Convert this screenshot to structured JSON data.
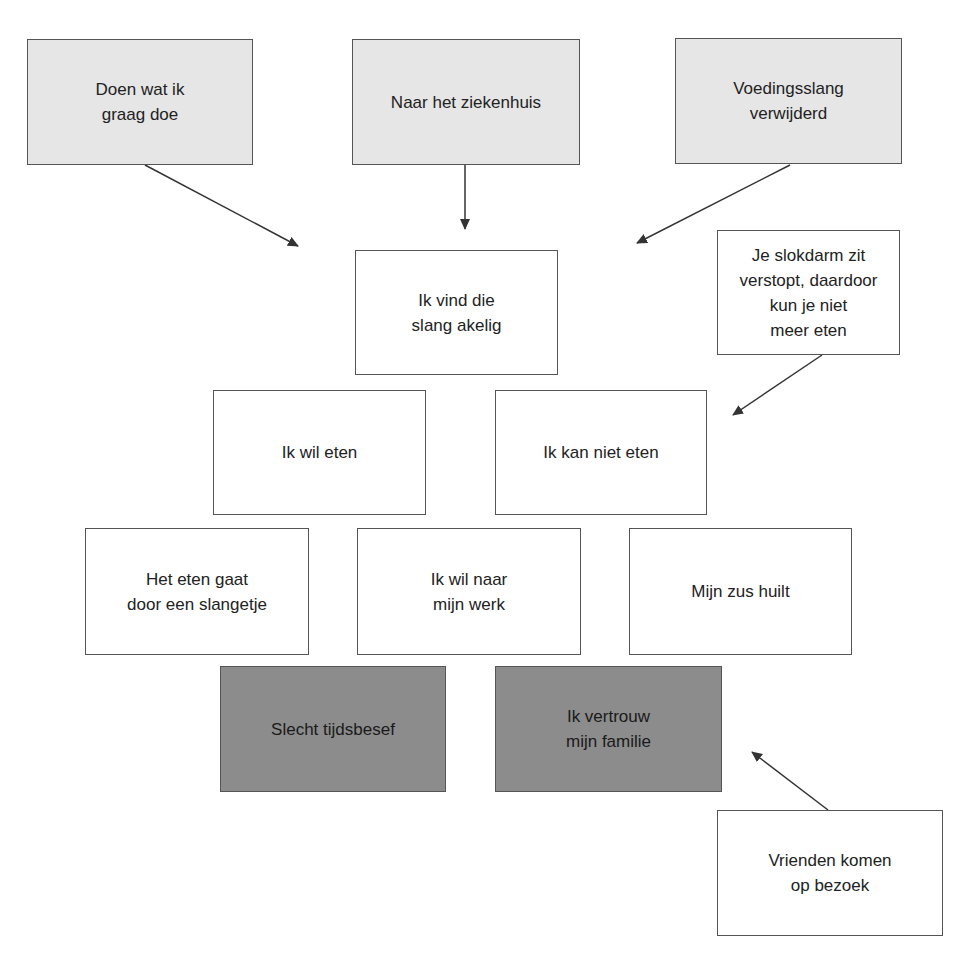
{
  "diagram": {
    "nodes": [
      {
        "id": "n1",
        "label": "Doen wat ik\ngraag doe",
        "style": "light",
        "x": 27,
        "y": 39,
        "w": 226,
        "h": 126
      },
      {
        "id": "n2",
        "label": "Naar het ziekenhuis",
        "style": "light",
        "x": 352,
        "y": 39,
        "w": 228,
        "h": 126
      },
      {
        "id": "n3",
        "label": "Voedingsslang\nverwijderd",
        "style": "light",
        "x": 675,
        "y": 38,
        "w": 227,
        "h": 126
      },
      {
        "id": "n4",
        "label": "Ik vind die\nslang akelig",
        "style": "white",
        "x": 355,
        "y": 250,
        "w": 203,
        "h": 125
      },
      {
        "id": "n5",
        "label": "Je slokdarm zit\nverstopt, daardoor\nkun je niet\nmeer eten",
        "style": "white",
        "x": 717,
        "y": 230,
        "w": 183,
        "h": 125
      },
      {
        "id": "n6",
        "label": "Ik wil eten",
        "style": "white",
        "x": 213,
        "y": 390,
        "w": 213,
        "h": 125
      },
      {
        "id": "n7",
        "label": "Ik kan niet eten",
        "style": "white",
        "x": 495,
        "y": 390,
        "w": 212,
        "h": 125
      },
      {
        "id": "n8",
        "label": "Het eten gaat\ndoor een slangetje",
        "style": "white",
        "x": 85,
        "y": 528,
        "w": 224,
        "h": 127
      },
      {
        "id": "n9",
        "label": "Ik wil naar\nmijn werk",
        "style": "white",
        "x": 357,
        "y": 528,
        "w": 224,
        "h": 127
      },
      {
        "id": "n10",
        "label": "Mijn zus huilt",
        "style": "white",
        "x": 629,
        "y": 528,
        "w": 223,
        "h": 127
      },
      {
        "id": "n11",
        "label": "Slecht tijdsbesef",
        "style": "dark",
        "x": 220,
        "y": 666,
        "w": 226,
        "h": 126
      },
      {
        "id": "n12",
        "label": "Ik vertrouw\nmijn familie",
        "style": "dark",
        "x": 495,
        "y": 666,
        "w": 227,
        "h": 126
      },
      {
        "id": "n13",
        "label": "Vrienden komen\nop bezoek",
        "style": "white",
        "x": 717,
        "y": 810,
        "w": 226,
        "h": 126
      }
    ],
    "edges": [
      {
        "from": "n1",
        "x1": 145,
        "y1": 165,
        "x2": 298,
        "y2": 246
      },
      {
        "from": "n2",
        "x1": 465,
        "y1": 165,
        "x2": 465,
        "y2": 229
      },
      {
        "from": "n3",
        "x1": 790,
        "y1": 165,
        "x2": 637,
        "y2": 243
      },
      {
        "from": "n5",
        "x1": 822,
        "y1": 355,
        "x2": 733,
        "y2": 415
      },
      {
        "from": "n13",
        "x1": 828,
        "y1": 810,
        "x2": 752,
        "y2": 752
      }
    ],
    "colors": {
      "light_fill": "#e6e6e6",
      "white_fill": "#ffffff",
      "dark_fill": "#8c8c8c",
      "border": "#555555",
      "arrow": "#333333",
      "text": "#222222"
    }
  }
}
